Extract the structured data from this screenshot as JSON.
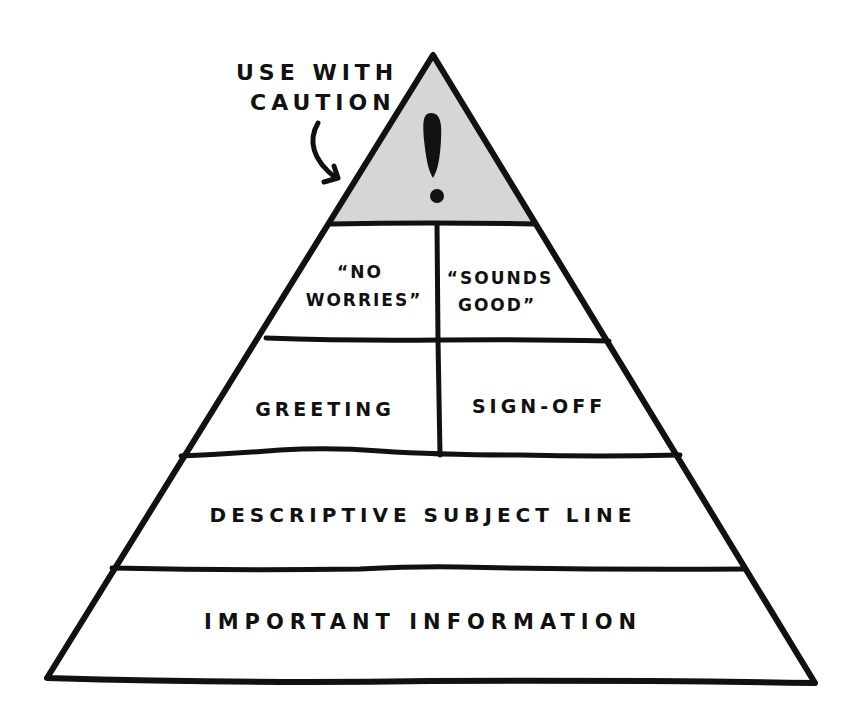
{
  "diagram": {
    "type": "pyramid",
    "colors": {
      "stroke": "#111111",
      "caution_fill": "#d6d6d6",
      "background": "#ffffff"
    },
    "annotation": {
      "line1": "USE WITH",
      "line2": "CAUTION",
      "arrow": "curved-arrow pointing to top tier"
    },
    "tiers": [
      {
        "level": 1,
        "position": "top",
        "icon": "exclamation-icon",
        "cells": [
          {
            "label": "!"
          }
        ]
      },
      {
        "level": 2,
        "position": "second",
        "cells": [
          {
            "label_line1": "“NO",
            "label_line2": "WORRIES”"
          },
          {
            "label_line1": "“SOUNDS",
            "label_line2": "GOOD”"
          }
        ]
      },
      {
        "level": 3,
        "position": "third",
        "cells": [
          {
            "label": "GREETING"
          },
          {
            "label": "SIGN-OFF"
          }
        ]
      },
      {
        "level": 4,
        "position": "fourth",
        "cells": [
          {
            "label": "DESCRIPTIVE SUBJECT LINE"
          }
        ]
      },
      {
        "level": 5,
        "position": "base",
        "cells": [
          {
            "label": "IMPORTANT INFORMATION"
          }
        ]
      }
    ]
  }
}
